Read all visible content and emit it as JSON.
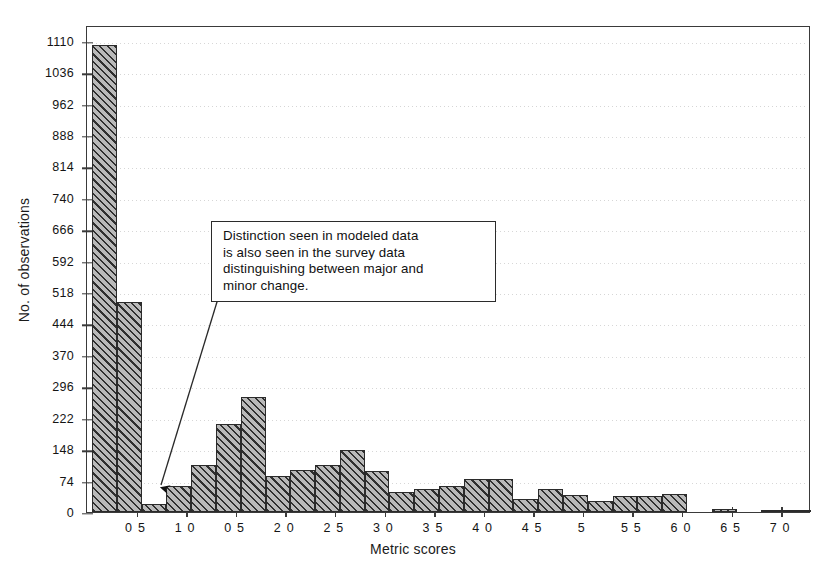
{
  "chart_data": {
    "type": "bar",
    "title": "",
    "xlabel": "Metric scores",
    "ylabel": "No. of observations",
    "ylim": [
      0,
      1147
    ],
    "xlim": [
      0.0,
      7.3
    ],
    "grid": true,
    "legend": "none",
    "y_ticks": [
      0,
      74,
      148,
      222,
      296,
      370,
      444,
      518,
      592,
      666,
      740,
      814,
      888,
      962,
      1036,
      1110
    ],
    "x_tick_labels": [
      "0 5",
      "1 0",
      "0 5",
      "2 0",
      "2 5",
      "3 0",
      "3 5",
      "4 0",
      "4 5",
      "5",
      "5 5",
      "6 0",
      "6 5",
      "7 0"
    ],
    "x_tick_values": [
      0.5,
      1.0,
      1.5,
      2.0,
      2.5,
      3.0,
      3.5,
      4.0,
      4.5,
      5.0,
      5.5,
      6.0,
      6.5,
      7.0
    ],
    "bin_width": 0.25,
    "bin_starts": [
      0.05,
      0.3,
      0.55,
      0.8,
      1.05,
      1.3,
      1.55,
      1.8,
      2.05,
      2.3,
      2.55,
      2.8,
      3.05,
      3.3,
      3.55,
      3.8,
      4.05,
      4.3,
      4.55,
      4.8,
      5.05,
      5.3,
      5.55,
      5.8,
      6.05,
      6.3,
      6.55,
      6.8,
      7.05
    ],
    "values": [
      1100,
      495,
      20,
      62,
      111,
      207,
      270,
      85,
      100,
      111,
      145,
      96,
      48,
      55,
      62,
      78,
      78,
      30,
      55,
      40,
      25,
      38,
      38,
      42,
      0,
      8,
      0,
      5,
      3
    ],
    "annotations": [
      {
        "text": "Distinction seen in modeled data is also seen in the survey data distinguishing between major and minor change.",
        "lines": [
          "Distinction seen in modeled data",
          "is also seen in the survey data",
          "distinguishing between major and",
          "minor change."
        ],
        "points_to_x": 0.62,
        "points_to_y": 35
      }
    ],
    "colors": {
      "bar_face": "#b9b9b9",
      "bar_hatch": "#282828",
      "bar_edge": "#2b2b2b",
      "axis": "#3a3a3a",
      "grid": "#c9c9c9",
      "text": "#141414",
      "annotation_border": "#2b2b2b",
      "annotation_bg": "#ffffff"
    }
  }
}
